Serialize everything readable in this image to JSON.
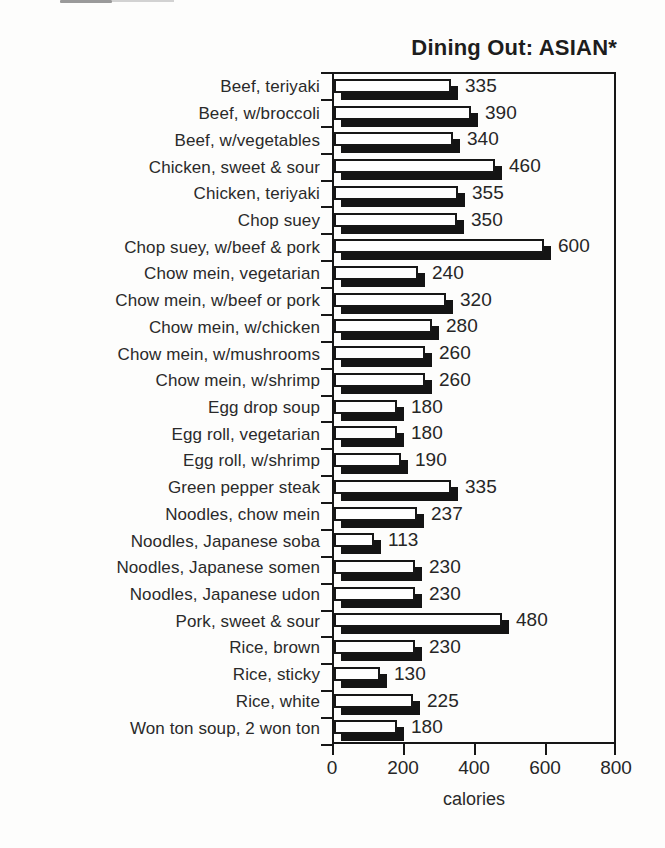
{
  "page": {
    "background": "#fdfdfc",
    "ink_color": "#161616",
    "text_color": "#2a2a2a"
  },
  "chart_data": {
    "type": "bar",
    "orientation": "horizontal",
    "title": "Dining Out: ASIAN*",
    "xlabel": "calories",
    "xlim": [
      0,
      800
    ],
    "xticks": [
      0,
      200,
      400,
      600,
      800
    ],
    "grid": false,
    "legend": "none",
    "value_labels_shown": true,
    "bar_style": {
      "fill": "#fefefe",
      "border": "#161616",
      "shadow": "#141414",
      "shadow_offset_px": 7
    },
    "categories": [
      "Beef, teriyaki",
      "Beef, w/broccoli",
      "Beef, w/vegetables",
      "Chicken, sweet & sour",
      "Chicken, teriyaki",
      "Chop suey",
      "Chop suey, w/beef & pork",
      "Chow mein, vegetarian",
      "Chow mein, w/beef or pork",
      "Chow mein, w/chicken",
      "Chow mein, w/mushrooms",
      "Chow mein, w/shrimp",
      "Egg drop soup",
      "Egg roll, vegetarian",
      "Egg roll, w/shrimp",
      "Green pepper steak",
      "Noodles, chow mein",
      "Noodles, Japanese soba",
      "Noodles, Japanese somen",
      "Noodles, Japanese udon",
      "Pork, sweet & sour",
      "Rice, brown",
      "Rice, sticky",
      "Rice, white",
      "Won ton soup, 2 won ton"
    ],
    "values": [
      335,
      390,
      340,
      460,
      355,
      350,
      600,
      240,
      320,
      280,
      260,
      260,
      180,
      180,
      190,
      335,
      237,
      113,
      230,
      230,
      480,
      230,
      130,
      225,
      180
    ]
  }
}
